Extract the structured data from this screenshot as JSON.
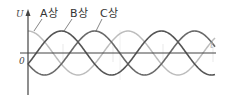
{
  "chart_data": {
    "type": "line",
    "title": "",
    "xlabel": "t",
    "ylabel": "U",
    "origin_label": "0",
    "x_range_periods": [
      0,
      1.85
    ],
    "y_range": [
      -1.1,
      1.1
    ],
    "series": [
      {
        "name": "A상",
        "phase_deg": 0,
        "amplitude": 1,
        "color": "#bdbdbd",
        "label_color": "#333333"
      },
      {
        "name": "B상",
        "phase_deg": -120,
        "amplitude": 1,
        "color": "#555555",
        "label_color": "#333333"
      },
      {
        "name": "C상",
        "phase_deg": -240,
        "amplitude": 1,
        "color": "#6a6a6a",
        "label_color": "#333333"
      }
    ],
    "function": "cos"
  }
}
